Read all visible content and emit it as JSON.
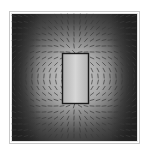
{
  "figure": {
    "kind": "vector-field-plot",
    "background": "#ffffff",
    "frame": {
      "x": 10,
      "y": 12,
      "width": 129,
      "height": 131,
      "outer_color": "#c8c8c8",
      "inner_color": "#e0e0e0"
    },
    "magnitude_colormap": {
      "low": "#2a2a2a",
      "high": "#dcdcdc"
    },
    "object": {
      "shape": "rectangle",
      "x": 62,
      "y": 53,
      "width": 26,
      "height": 50,
      "stroke": "#1a1a1a",
      "fill": "#c8c8c8"
    },
    "arrow_color": "#3a3a3a",
    "grid_step": 6
  }
}
